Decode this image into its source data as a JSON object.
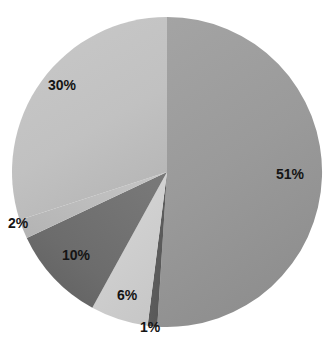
{
  "chart_data": {
    "type": "pie",
    "title": "",
    "subtitle": "",
    "xlabel": "",
    "ylabel": "",
    "legend": "none",
    "grid": false,
    "start_angle_deg": 0,
    "direction": "clockwise",
    "center": {
      "x": 167,
      "y": 172
    },
    "radius": 155,
    "categories": [
      "51%",
      "1%",
      "6%",
      "10%",
      "2%",
      "30%"
    ],
    "values": [
      51,
      1,
      6,
      10,
      2,
      30
    ],
    "total": 100,
    "units": "percent",
    "slices": [
      {
        "label": "51%",
        "value": 51,
        "color": "#9a9a9a",
        "label_position": "inside",
        "label_x": 276,
        "label_y": 174
      },
      {
        "label": "1%",
        "value": 1,
        "color": "#5c5c5c",
        "label_position": "outside",
        "label_x": 140,
        "label_y": 327
      },
      {
        "label": "6%",
        "value": 6,
        "color": "#cfcfcf",
        "label_position": "inside",
        "label_x": 117,
        "label_y": 288
      },
      {
        "label": "10%",
        "value": 10,
        "color": "#6d6d6d",
        "label_position": "inside",
        "label_x": 62,
        "label_y": 249
      },
      {
        "label": "2%",
        "value": 2,
        "color": "#bdbdbd",
        "label_position": "outside",
        "label_x": 8,
        "label_y": 222
      },
      {
        "label": "30%",
        "value": 30,
        "color": "#c2c2c2",
        "label_position": "inside",
        "label_x": 48,
        "label_y": 84
      }
    ],
    "colors": {
      "background": "#ffffff",
      "label_text": "#141414"
    }
  }
}
